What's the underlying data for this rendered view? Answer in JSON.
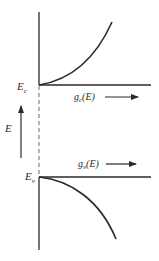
{
  "diagram": {
    "labels": {
      "ec_main": "E",
      "ec_sub": "c",
      "ev_main": "E",
      "ev_sub": "v",
      "energy_axis": "E",
      "gc_main": "g",
      "gc_sub": "c",
      "gc_arg": "(E)",
      "gv_main": "g",
      "gv_sub": "v",
      "gv_arg": "(E)"
    },
    "colors": {
      "line": "#2a2a2a",
      "dashed": "#6a6a6a",
      "background": "#ffffff"
    }
  }
}
